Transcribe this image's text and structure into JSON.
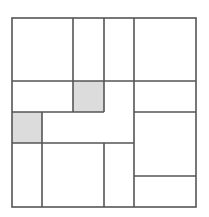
{
  "diagram": {
    "colors": {
      "line": "#555555",
      "shade": "#dcdcdc",
      "background": "#ffffff"
    },
    "outer": {
      "x": 12,
      "y": 18,
      "w": 184,
      "h": 189
    },
    "shaded": [
      {
        "x": 73,
        "y": 81,
        "w": 31,
        "h": 31
      },
      {
        "x": 12,
        "y": 112,
        "w": 30,
        "h": 31
      }
    ],
    "lines": [
      {
        "x1": 73,
        "y1": 18,
        "x2": 73,
        "y2": 112
      },
      {
        "x1": 104,
        "y1": 18,
        "x2": 104,
        "y2": 112
      },
      {
        "x1": 134,
        "y1": 18,
        "x2": 134,
        "y2": 207
      },
      {
        "x1": 12,
        "y1": 81,
        "x2": 196,
        "y2": 81
      },
      {
        "x1": 12,
        "y1": 112,
        "x2": 104,
        "y2": 112
      },
      {
        "x1": 134,
        "y1": 112,
        "x2": 196,
        "y2": 112
      },
      {
        "x1": 42,
        "y1": 112,
        "x2": 42,
        "y2": 207
      },
      {
        "x1": 12,
        "y1": 143,
        "x2": 134,
        "y2": 143
      },
      {
        "x1": 104,
        "y1": 143,
        "x2": 104,
        "y2": 207
      },
      {
        "x1": 134,
        "y1": 176,
        "x2": 196,
        "y2": 176
      }
    ]
  }
}
